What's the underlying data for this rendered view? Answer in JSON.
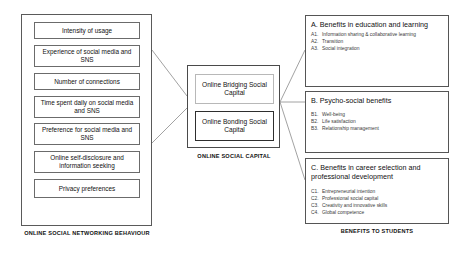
{
  "diagram": {
    "left_block": {
      "caption": "ONLINE SOCIAL NETWORKING BEHAVIOUR",
      "items": [
        {
          "label": "Intensity of usage"
        },
        {
          "label": "Experience of social media and SNS"
        },
        {
          "label": "Number of connections"
        },
        {
          "label": "Time spent daily on social media and SNS"
        },
        {
          "label": "Preference for social media and SNS"
        },
        {
          "label": "Online self-disclosure and information seeking"
        },
        {
          "label": "Privacy preferences"
        }
      ]
    },
    "center_block": {
      "caption": "ONLINE SOCIAL CAPITAL",
      "items": [
        {
          "label": "Online Bridging Social Capital"
        },
        {
          "label": "Online Bonding Social Capital"
        }
      ]
    },
    "right_block": {
      "caption": "BENEFITS TO STUDENTS",
      "panels": [
        {
          "key": "A.",
          "title": "Benefits in education and learning",
          "subs": [
            {
              "key": "A1.",
              "text": "Information sharing & collaborative learning"
            },
            {
              "key": "A2.",
              "text": "Transition"
            },
            {
              "key": "A3.",
              "text": "Social integration"
            }
          ]
        },
        {
          "key": "B.",
          "title": "Psycho-social benefits",
          "subs": [
            {
              "key": "B1.",
              "text": "Well-being"
            },
            {
              "key": "B2.",
              "text": "Life satisfaction"
            },
            {
              "key": "B3.",
              "text": "Relationship management"
            }
          ]
        },
        {
          "key": "C.",
          "title": "Benefits in career selection and professional development",
          "subs": [
            {
              "key": "C1.",
              "text": "Entrepreneurial intention"
            },
            {
              "key": "C2.",
              "text": "Professional social capital"
            },
            {
              "key": "C3.",
              "text": "Creativity and innovative skills"
            },
            {
              "key": "C4.",
              "text": "Global competence"
            }
          ]
        }
      ]
    },
    "colors": {
      "line": "#8a8a8a",
      "border": "#555555",
      "text": "#111111"
    }
  }
}
